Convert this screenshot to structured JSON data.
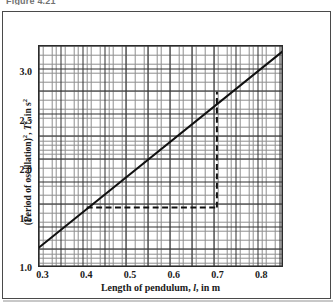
{
  "caption": "Figure 4.21",
  "chart_data": {
    "type": "line",
    "title": "",
    "xlabel": "Length of pendulum, l, in m",
    "ylabel": "(Period of oscillation)², T², in s²",
    "xlabel_parts": {
      "pre": "Length of pendulum, ",
      "symbol": "l",
      "post": ", in m"
    },
    "ylabel_parts": {
      "pre": "(Period of oscillation)",
      "sup1": "2",
      "mid": ", ",
      "symbol": "T",
      "sup2": "2",
      "post": ", in s",
      "sup3": "2"
    },
    "xlim": [
      0.29,
      0.85
    ],
    "ylim": [
      1.0,
      3.26
    ],
    "xticks": [
      "0.3",
      "0.4",
      "0.5",
      "0.6",
      "0.7",
      "0.8"
    ],
    "xtick_values": [
      0.3,
      0.4,
      0.5,
      0.6,
      0.7,
      0.8
    ],
    "yticks": [
      "1.0",
      "1.5",
      "2.0",
      "2.5",
      "3.0"
    ],
    "ytick_values": [
      1.0,
      1.5,
      2.0,
      2.5,
      3.0
    ],
    "grid": "minor and major graph paper, major every 0.1 in x and 0.5 in y",
    "legend": "none",
    "series": [
      {
        "name": "Best-fit line of T squared against l",
        "style": "solid",
        "x": [
          0.29,
          0.85
        ],
        "y": [
          1.19,
          3.2
        ],
        "slope": 3.59,
        "intercept": 0.15
      }
    ],
    "annotations": [
      {
        "name": "gradient-triangle-horizontal",
        "style": "dashed",
        "from": [
          0.4,
          1.6
        ],
        "to": [
          0.7,
          1.6
        ]
      },
      {
        "name": "gradient-triangle-vertical",
        "style": "dashed",
        "from": [
          0.7,
          1.6
        ],
        "to": [
          0.7,
          2.79
        ]
      }
    ]
  }
}
